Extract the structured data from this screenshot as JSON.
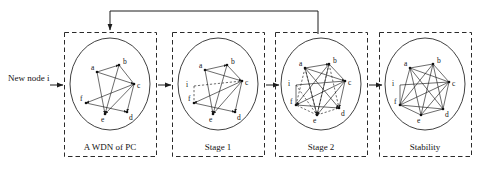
{
  "figure": {
    "entry_label": "New node i",
    "feedback_arrow": "loop-back-to-first-panel"
  },
  "panels": [
    {
      "id": "wdn",
      "caption": "A WDN of PC"
    },
    {
      "id": "stage1",
      "caption": "Stage 1"
    },
    {
      "id": "stage2",
      "caption": "Stage 2"
    },
    {
      "id": "stability",
      "caption": "Stability"
    }
  ],
  "node_labels": {
    "a": "a",
    "b": "b",
    "c": "c",
    "d": "d",
    "e": "e",
    "f": "f",
    "i": "i"
  },
  "graph_nodes": {
    "panel1": [
      {
        "id": "a",
        "label": "a",
        "x": 25,
        "y": 24,
        "lx": 19,
        "ly": 22
      },
      {
        "id": "b",
        "label": "b",
        "x": 47,
        "y": 17,
        "lx": 51,
        "ly": 16
      },
      {
        "id": "c",
        "label": "c",
        "x": 62,
        "y": 36,
        "lx": 66,
        "ly": 39
      },
      {
        "id": "d",
        "label": "d",
        "x": 55,
        "y": 64,
        "lx": 58,
        "ly": 70
      },
      {
        "id": "e",
        "label": "e",
        "x": 33,
        "y": 66,
        "lx": 31,
        "ly": 72
      },
      {
        "id": "f",
        "label": "f",
        "x": 14,
        "y": 55,
        "lx": 8,
        "ly": 54
      }
    ],
    "panel2": [
      {
        "id": "a",
        "label": "a",
        "x": 25,
        "y": 22,
        "lx": 19,
        "ly": 20
      },
      {
        "id": "b",
        "label": "b",
        "x": 47,
        "y": 17,
        "lx": 51,
        "ly": 16
      },
      {
        "id": "c",
        "label": "c",
        "x": 62,
        "y": 33,
        "lx": 66,
        "ly": 36
      },
      {
        "id": "d",
        "label": "d",
        "x": 55,
        "y": 64,
        "lx": 58,
        "ly": 70
      },
      {
        "id": "e",
        "label": "e",
        "x": 33,
        "y": 66,
        "lx": 31,
        "ly": 72
      },
      {
        "id": "f",
        "label": "f",
        "x": 14,
        "y": 55,
        "lx": 8,
        "ly": 54
      },
      {
        "id": "i",
        "label": "i",
        "x": 14,
        "y": 38,
        "lx": 8,
        "ly": 38
      }
    ],
    "panel3": [
      {
        "id": "a",
        "label": "a",
        "x": 22,
        "y": 20,
        "lx": 16,
        "ly": 18
      },
      {
        "id": "b",
        "label": "b",
        "x": 46,
        "y": 16,
        "lx": 50,
        "ly": 15
      },
      {
        "id": "c",
        "label": "c",
        "x": 62,
        "y": 33,
        "lx": 66,
        "ly": 36
      },
      {
        "id": "d",
        "label": "d",
        "x": 56,
        "y": 60,
        "lx": 59,
        "ly": 66
      },
      {
        "id": "e",
        "label": "e",
        "x": 34,
        "y": 67,
        "lx": 32,
        "ly": 73
      },
      {
        "id": "f",
        "label": "f",
        "x": 13,
        "y": 57,
        "lx": 7,
        "ly": 57
      },
      {
        "id": "i",
        "label": "i",
        "x": 13,
        "y": 37,
        "lx": 7,
        "ly": 37
      }
    ],
    "panel4": [
      {
        "id": "a",
        "label": "a",
        "x": 23,
        "y": 20,
        "lx": 17,
        "ly": 18
      },
      {
        "id": "b",
        "label": "b",
        "x": 46,
        "y": 16,
        "lx": 50,
        "ly": 15
      },
      {
        "id": "c",
        "label": "c",
        "x": 62,
        "y": 34,
        "lx": 66,
        "ly": 37
      },
      {
        "id": "d",
        "label": "d",
        "x": 56,
        "y": 61,
        "lx": 59,
        "ly": 67
      },
      {
        "id": "e",
        "label": "e",
        "x": 34,
        "y": 67,
        "lx": 32,
        "ly": 73
      },
      {
        "id": "f",
        "label": "f",
        "x": 13,
        "y": 57,
        "lx": 7,
        "ly": 57
      },
      {
        "id": "i",
        "label": "i",
        "x": 13,
        "y": 37,
        "lx": 7,
        "ly": 37
      }
    ]
  },
  "graph_edges": {
    "panel1_solid": [
      [
        "a",
        "b"
      ],
      [
        "a",
        "c"
      ],
      [
        "a",
        "e"
      ],
      [
        "b",
        "e"
      ],
      [
        "c",
        "e"
      ],
      [
        "c",
        "d"
      ],
      [
        "c",
        "f"
      ],
      [
        "f",
        "d"
      ]
    ],
    "panel2_solid": [
      [
        "a",
        "b"
      ],
      [
        "a",
        "c"
      ],
      [
        "a",
        "e"
      ],
      [
        "b",
        "e"
      ],
      [
        "c",
        "e"
      ],
      [
        "c",
        "d"
      ],
      [
        "c",
        "f"
      ],
      [
        "f",
        "d"
      ]
    ],
    "panel2_dashed": [
      [
        "i",
        "c"
      ],
      [
        "i",
        "f"
      ]
    ],
    "panel3_solid": [
      [
        "a",
        "b"
      ],
      [
        "a",
        "c"
      ],
      [
        "a",
        "e"
      ],
      [
        "b",
        "e"
      ],
      [
        "c",
        "e"
      ],
      [
        "c",
        "d"
      ],
      [
        "c",
        "f"
      ],
      [
        "f",
        "d"
      ],
      [
        "i",
        "c"
      ],
      [
        "i",
        "f"
      ],
      [
        "a",
        "d"
      ],
      [
        "b",
        "f"
      ]
    ],
    "panel3_dashed": [
      [
        "a",
        "f"
      ],
      [
        "b",
        "d"
      ],
      [
        "b",
        "c"
      ],
      [
        "e",
        "d"
      ],
      [
        "e",
        "f"
      ],
      [
        "a",
        "e"
      ]
    ],
    "panel4_solid": [
      [
        "a",
        "b"
      ],
      [
        "a",
        "c"
      ],
      [
        "a",
        "d"
      ],
      [
        "a",
        "e"
      ],
      [
        "a",
        "f"
      ],
      [
        "b",
        "c"
      ],
      [
        "b",
        "d"
      ],
      [
        "b",
        "e"
      ],
      [
        "b",
        "f"
      ],
      [
        "c",
        "d"
      ],
      [
        "c",
        "e"
      ],
      [
        "c",
        "f"
      ],
      [
        "d",
        "e"
      ],
      [
        "d",
        "f"
      ],
      [
        "e",
        "f"
      ],
      [
        "i",
        "c"
      ],
      [
        "i",
        "f"
      ]
    ]
  },
  "colors": {
    "ink": "#1c1c1c",
    "border": "#2b2b2b",
    "background": "#ffffff"
  }
}
